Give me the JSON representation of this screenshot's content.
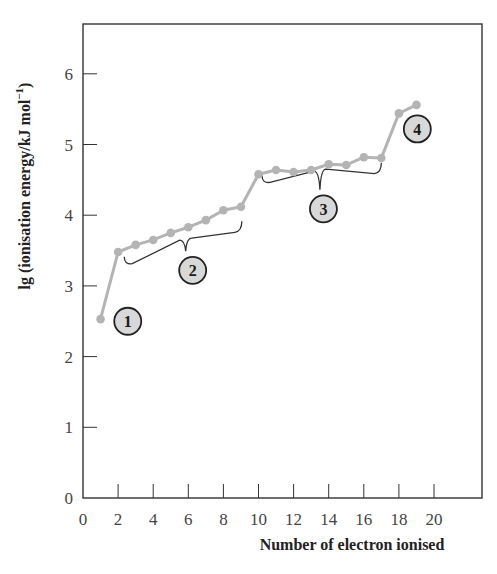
{
  "chart_data": {
    "type": "line",
    "title": "",
    "xlabel": "Number of electron ionised",
    "ylabel": "lg (ionisation energy/kJ mol⁻¹)",
    "ylabel_parts": {
      "main": "lg (ionisation energy/kJ mol",
      "sup": "−1",
      "close": ")"
    },
    "xlim": [
      0,
      22.7
    ],
    "ylim": [
      0,
      6.7
    ],
    "x_ticks": [
      0,
      2,
      4,
      6,
      8,
      10,
      12,
      14,
      16,
      18,
      20
    ],
    "y_ticks": [
      0,
      1,
      2,
      3,
      4,
      5,
      6
    ],
    "grid": false,
    "legend": null,
    "series": [
      {
        "name": "successive ionisation energies",
        "color": "#b4b4b4",
        "x": [
          1,
          2,
          3,
          4,
          5,
          6,
          7,
          8,
          9,
          10,
          11,
          12,
          13,
          14,
          15,
          16,
          17,
          18,
          19
        ],
        "values": [
          2.53,
          3.48,
          3.58,
          3.65,
          3.75,
          3.83,
          3.93,
          4.07,
          4.12,
          4.58,
          4.64,
          4.61,
          4.64,
          4.72,
          4.71,
          4.82,
          4.81,
          5.44,
          5.56
        ]
      }
    ],
    "annotations": [
      {
        "label": "1",
        "type": "circle-badge",
        "x": 2.55,
        "y": 2.5
      },
      {
        "label": "2",
        "type": "circle-badge",
        "x": 6.25,
        "y": 3.22,
        "brace": {
          "from": [
            2.35,
            3.3
          ],
          "to": [
            9.05,
            3.8
          ],
          "tip": [
            5.85,
            3.49
          ]
        }
      },
      {
        "label": "3",
        "type": "circle-badge",
        "x": 13.7,
        "y": 4.09,
        "brace": {
          "from": [
            10.2,
            4.45
          ],
          "to": [
            17.0,
            4.63
          ],
          "tip": [
            13.5,
            4.36
          ]
        }
      },
      {
        "label": "4",
        "type": "circle-badge",
        "x": 19.05,
        "y": 5.22
      }
    ]
  },
  "style": {
    "line_color": "#b4b4b4",
    "axis_color": "#333333",
    "badge_fill": "#d8d8d8",
    "badge_stroke": "#222222",
    "brace_color": "#333333"
  }
}
